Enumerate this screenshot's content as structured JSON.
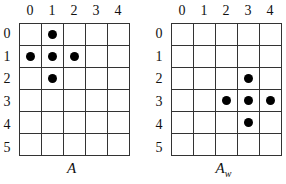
{
  "panels": [
    {
      "caption": "A",
      "caption_sub": "",
      "columns": [
        "0",
        "1",
        "2",
        "3",
        "4"
      ],
      "rows": [
        "0",
        "1",
        "2",
        "3",
        "4",
        "5"
      ],
      "dots": [
        [
          0,
          1
        ],
        [
          1,
          0
        ],
        [
          1,
          1
        ],
        [
          1,
          2
        ],
        [
          2,
          1
        ]
      ]
    },
    {
      "caption": "A",
      "caption_sub": "w",
      "columns": [
        "0",
        "1",
        "2",
        "3",
        "4"
      ],
      "rows": [
        "0",
        "1",
        "2",
        "3",
        "4",
        "5"
      ],
      "dots": [
        [
          2,
          3
        ],
        [
          3,
          2
        ],
        [
          3,
          3
        ],
        [
          3,
          4
        ],
        [
          4,
          3
        ]
      ]
    }
  ]
}
